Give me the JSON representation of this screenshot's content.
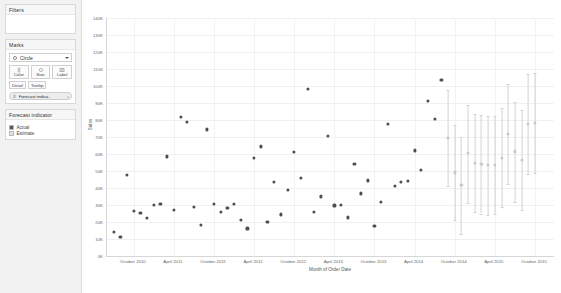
{
  "sidebar": {
    "filters": {
      "title": "Filters"
    },
    "marks": {
      "title": "Marks",
      "mark_type": "Circle",
      "mark_type_icon": "circle-mark-icon",
      "caret_icon": "chevron-down-icon",
      "buttons": [
        {
          "label": "Color",
          "icon": "color-palette-icon"
        },
        {
          "label": "Size",
          "icon": "size-icon"
        },
        {
          "label": "Label",
          "icon": "label-icon"
        }
      ],
      "small_buttons": [
        {
          "label": "Detail",
          "icon": "detail-icon"
        },
        {
          "label": "Tooltip",
          "icon": "tooltip-icon"
        }
      ],
      "pill": {
        "label": "Forecast indica..",
        "icon": "color-shelf-icon",
        "tail": "⌕"
      }
    },
    "legend": {
      "title": "Forecast indicator",
      "items": [
        {
          "label": "Actual",
          "color": "#555559"
        },
        {
          "label": "Estimate",
          "color": "#e2e2e4"
        }
      ]
    }
  },
  "chart_data": {
    "type": "scatter",
    "title": "",
    "xlabel": "Month of Order Date",
    "ylabel": "Sales",
    "ylim": [
      0,
      140000
    ],
    "ytick_labels": [
      "0K",
      "10K",
      "20K",
      "30K",
      "40K",
      "50K",
      "60K",
      "70K",
      "80K",
      "90K",
      "100K",
      "110K",
      "120K",
      "130K",
      "140K"
    ],
    "ytick_values": [
      0,
      10000,
      20000,
      30000,
      40000,
      50000,
      60000,
      70000,
      80000,
      90000,
      100000,
      110000,
      120000,
      130000,
      140000
    ],
    "xtick_labels": [
      "October 2010",
      "April 2011",
      "October 2011",
      "April 2012",
      "October 2012",
      "April 2013",
      "October 2013",
      "April 2014",
      "October 2014",
      "April 2015",
      "October 2015"
    ],
    "xtick_months": [
      10,
      16,
      22,
      28,
      34,
      40,
      46,
      52,
      58,
      64,
      70
    ],
    "x_range_months": [
      6,
      73
    ],
    "grid": true,
    "legend_position": "sidebar",
    "series": [
      {
        "name": "Actual",
        "color": "#4e4e52",
        "points": [
          {
            "m": 7,
            "y": 14200
          },
          {
            "m": 8,
            "y": 11300
          },
          {
            "m": 9,
            "y": 47800
          },
          {
            "m": 10,
            "y": 26500
          },
          {
            "m": 11,
            "y": 25200
          },
          {
            "m": 12,
            "y": 22100
          },
          {
            "m": 13,
            "y": 29700
          },
          {
            "m": 14,
            "y": 30300
          },
          {
            "m": 15,
            "y": 58500
          },
          {
            "m": 16,
            "y": 27100
          },
          {
            "m": 17,
            "y": 81700
          },
          {
            "m": 18,
            "y": 79000
          },
          {
            "m": 19,
            "y": 28800
          },
          {
            "m": 20,
            "y": 18200
          },
          {
            "m": 21,
            "y": 74300
          },
          {
            "m": 22,
            "y": 30600
          },
          {
            "m": 23,
            "y": 25600
          },
          {
            "m": 24,
            "y": 28200
          },
          {
            "m": 25,
            "y": 30400
          },
          {
            "m": 26,
            "y": 21300
          },
          {
            "m": 27,
            "y": 16100
          },
          {
            "m": 28,
            "y": 57400
          },
          {
            "m": 29,
            "y": 64300
          },
          {
            "m": 30,
            "y": 20000
          },
          {
            "m": 31,
            "y": 43500
          },
          {
            "m": 32,
            "y": 24300
          },
          {
            "m": 33,
            "y": 38800
          },
          {
            "m": 34,
            "y": 60900
          },
          {
            "m": 35,
            "y": 45600
          },
          {
            "m": 36,
            "y": 98400
          },
          {
            "m": 37,
            "y": 26000
          },
          {
            "m": 38,
            "y": 34900
          },
          {
            "m": 39,
            "y": 70500
          },
          {
            "m": 40,
            "y": 29600
          },
          {
            "m": 41,
            "y": 30100
          },
          {
            "m": 42,
            "y": 22600
          },
          {
            "m": 43,
            "y": 54100
          },
          {
            "m": 44,
            "y": 36700
          },
          {
            "m": 45,
            "y": 44300
          },
          {
            "m": 46,
            "y": 17500
          },
          {
            "m": 47,
            "y": 31800
          },
          {
            "m": 48,
            "y": 77800
          },
          {
            "m": 49,
            "y": 41300
          },
          {
            "m": 50,
            "y": 43700
          },
          {
            "m": 51,
            "y": 43900
          },
          {
            "m": 52,
            "y": 62000
          },
          {
            "m": 53,
            "y": 50600
          },
          {
            "m": 54,
            "y": 91200
          },
          {
            "m": 55,
            "y": 80300
          },
          {
            "m": 56,
            "y": 103500
          }
        ]
      },
      {
        "name": "Estimate",
        "color": "#d6d6d9",
        "points": [
          {
            "m": 57,
            "y": 69400,
            "lo": 40900,
            "hi": 97500
          },
          {
            "m": 58,
            "y": 49100,
            "lo": 21300,
            "hi": 77100
          },
          {
            "m": 59,
            "y": 41500,
            "lo": 13200,
            "hi": 69800
          },
          {
            "m": 60,
            "y": 60300,
            "lo": 31400,
            "hi": 88700
          },
          {
            "m": 61,
            "y": 54700,
            "lo": 26100,
            "hi": 83600
          },
          {
            "m": 62,
            "y": 54000,
            "lo": 25000,
            "hi": 82900
          },
          {
            "m": 63,
            "y": 53300,
            "lo": 24400,
            "hi": 82300
          },
          {
            "m": 64,
            "y": 53600,
            "lo": 24600,
            "hi": 82500
          },
          {
            "m": 65,
            "y": 57800,
            "lo": 28700,
            "hi": 86800
          },
          {
            "m": 66,
            "y": 71800,
            "lo": 42400,
            "hi": 101000
          },
          {
            "m": 67,
            "y": 61400,
            "lo": 32000,
            "hi": 90800
          },
          {
            "m": 68,
            "y": 56200,
            "lo": 27000,
            "hi": 85600
          },
          {
            "m": 69,
            "y": 77500,
            "lo": 48000,
            "hi": 107000
          },
          {
            "m": 70,
            "y": 78200,
            "lo": 48600,
            "hi": 107800
          }
        ]
      }
    ]
  }
}
